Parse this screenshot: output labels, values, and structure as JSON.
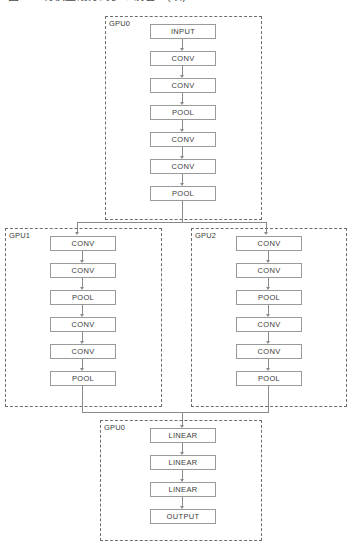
{
  "caption": {
    "text": "图 7-7 将模型划分到多个设备上(续)"
  },
  "colors": {
    "box_border": "#9a9a9a",
    "group_border": "#6e6e6e",
    "connector": "#8a8a8a",
    "text": "#3b3b3b",
    "background": "#ffffff"
  },
  "groups": [
    {
      "id": "gpu0-top",
      "label": "GPU0",
      "x": 105,
      "y": 16,
      "width": 157,
      "height": 204,
      "nodes": [
        {
          "label": "INPUT",
          "x": 150,
          "y": 24
        },
        {
          "label": "CONV",
          "x": 150,
          "y": 51
        },
        {
          "label": "CONV",
          "x": 150,
          "y": 78
        },
        {
          "label": "POOL",
          "x": 150,
          "y": 105
        },
        {
          "label": "CONV",
          "x": 150,
          "y": 132
        },
        {
          "label": "CONV",
          "x": 150,
          "y": 159
        },
        {
          "label": "POOL",
          "x": 150,
          "y": 186
        }
      ]
    },
    {
      "id": "gpu1",
      "label": "GPU1",
      "x": 5,
      "y": 228,
      "width": 157,
      "height": 179,
      "nodes": [
        {
          "label": "CONV",
          "x": 50,
          "y": 236
        },
        {
          "label": "CONV",
          "x": 50,
          "y": 263
        },
        {
          "label": "POOL",
          "x": 50,
          "y": 290
        },
        {
          "label": "CONV",
          "x": 50,
          "y": 317
        },
        {
          "label": "CONV",
          "x": 50,
          "y": 344
        },
        {
          "label": "POOL",
          "x": 50,
          "y": 371
        }
      ]
    },
    {
      "id": "gpu2",
      "label": "GPU2",
      "x": 191,
      "y": 228,
      "width": 156,
      "height": 179,
      "nodes": [
        {
          "label": "CONV",
          "x": 236,
          "y": 236
        },
        {
          "label": "CONV",
          "x": 236,
          "y": 263
        },
        {
          "label": "POOL",
          "x": 236,
          "y": 290
        },
        {
          "label": "CONV",
          "x": 236,
          "y": 317
        },
        {
          "label": "CONV",
          "x": 236,
          "y": 344
        },
        {
          "label": "POOL",
          "x": 236,
          "y": 371
        }
      ]
    },
    {
      "id": "gpu0-bottom",
      "label": "GPU0",
      "x": 100,
      "y": 420,
      "width": 162,
      "height": 121,
      "nodes": [
        {
          "label": "LINEAR",
          "x": 150,
          "y": 428
        },
        {
          "label": "LINEAR",
          "x": 150,
          "y": 455
        },
        {
          "label": "LINEAR",
          "x": 150,
          "y": 482
        },
        {
          "label": "OUTPUT",
          "x": 150,
          "y": 509
        }
      ]
    }
  ],
  "node_size": {
    "width": 66,
    "height": 15
  },
  "flow": {
    "split_label": "fan-out from GPU0 to GPU1 and GPU2",
    "merge_label": "fan-in from GPU1 and GPU2 to GPU0"
  }
}
